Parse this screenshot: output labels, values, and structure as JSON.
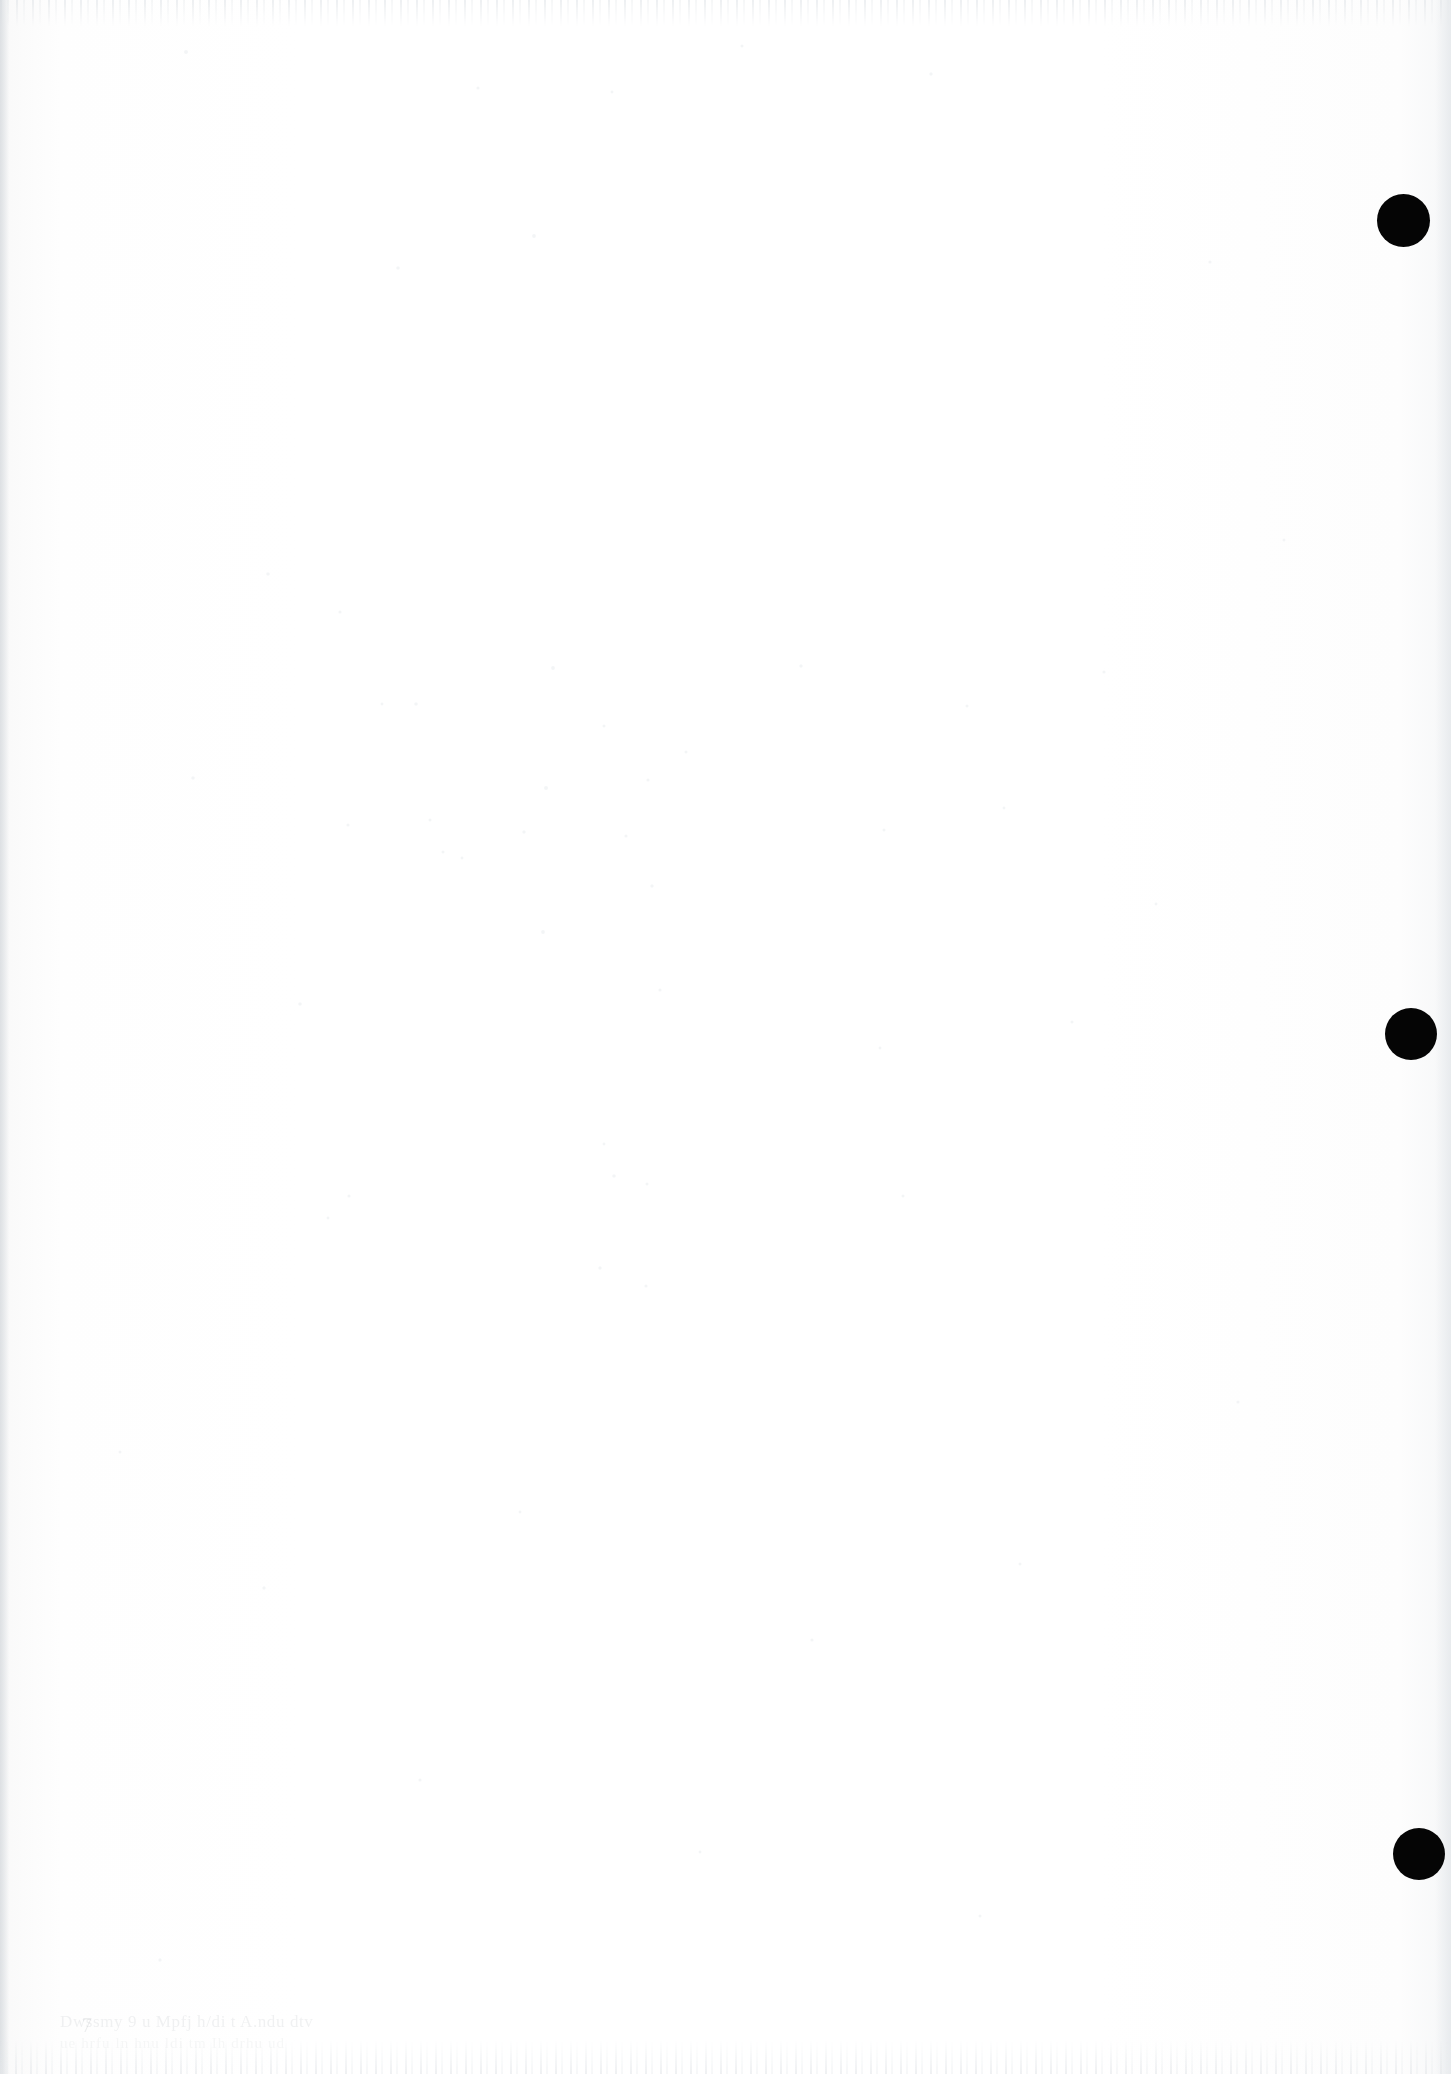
{
  "page": {
    "kind": "scanned-blank-page",
    "width": 1451,
    "height": 2074,
    "background_color": "#fdfdfd",
    "paper_tone": "#fefefe"
  },
  "registration_dots": {
    "label": "registration-dots",
    "count": 3,
    "color": "#050505",
    "dots": [
      {
        "name": "registration-dot-1",
        "cx": 1403,
        "cy": 220,
        "diameter": 53
      },
      {
        "name": "registration-dot-2",
        "cx": 1411,
        "cy": 1034,
        "diameter": 52
      },
      {
        "name": "registration-dot-3",
        "cx": 1419,
        "cy": 1854,
        "diameter": 52
      }
    ]
  },
  "footer": {
    "note": "ghost-text, illegible",
    "mark": "7",
    "line_1": "Dwssmy 9 u  Mpfj  h/di t  A.ndu  dtv",
    "line_2": "ue  hrfu ln   hnu ldi   tm Ih drhu  ud"
  },
  "scan_artifacts": {
    "top_streak": true,
    "bottom_streak": true,
    "left_edge_shadow": true,
    "right_edge_shadow": true,
    "speckle": true
  }
}
